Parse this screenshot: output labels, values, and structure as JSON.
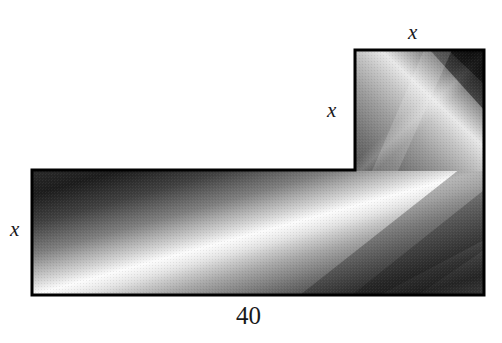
{
  "figure": {
    "background_color": "#ffffff",
    "outline_color": "#000000",
    "outline_width_px": 3,
    "labels": {
      "x_top": "x",
      "x_middle": "x",
      "x_left": "x",
      "base_length": "40"
    },
    "shape": {
      "type": "L-shape-polygon",
      "vertices": [
        {
          "x": 32,
          "y": 170
        },
        {
          "x": 355,
          "y": 170
        },
        {
          "x": 355,
          "y": 50
        },
        {
          "x": 484,
          "y": 50
        },
        {
          "x": 484,
          "y": 295
        },
        {
          "x": 32,
          "y": 295
        }
      ],
      "main_rect": {
        "left": 32,
        "top": 170,
        "right": 484,
        "bottom": 295
      },
      "tall_rect": {
        "left": 355,
        "top": 50,
        "right": 484,
        "bottom": 170
      }
    },
    "dimensions": [
      {
        "name": "x_top",
        "label": "x",
        "edge": "top edge of upper rectangle"
      },
      {
        "name": "x_middle",
        "label": "x",
        "edge": "left edge of upper rectangle"
      },
      {
        "name": "x_left",
        "label": "x",
        "edge": "left edge of lower rectangle"
      },
      {
        "name": "base",
        "label": "40",
        "edge": "bottom edge of lower rectangle"
      }
    ],
    "shading": {
      "style": "diagonal metallic gradient",
      "dark_color": "#1c1c1c",
      "mid_color": "#8c8c8c",
      "light_color": "#f2f2f2",
      "angle_deg": 45
    }
  }
}
